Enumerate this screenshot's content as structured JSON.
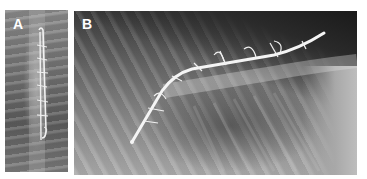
{
  "figure": {
    "panels": [
      {
        "label": "A",
        "view": "dorsoventral radiograph of spine with implant"
      },
      {
        "label": "B",
        "view": "lateral radiograph of spine with implant"
      }
    ]
  },
  "colors": {
    "background": "#ffffff",
    "label": "#ffffff",
    "implant": "#f2f2f2"
  }
}
